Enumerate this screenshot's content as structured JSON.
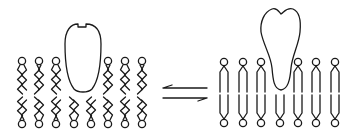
{
  "diagram": {
    "colors": {
      "stroke": "#1a1a1a",
      "background": "#ffffff"
    },
    "left_panel": {
      "state": "disordered-bilayer",
      "protein": {
        "shape": "rounded-capsule-with-notch",
        "x": 64,
        "y": 22,
        "width": 38,
        "height": 70
      },
      "top_leaflet_heads_x": [
        22,
        39,
        56,
        108,
        125,
        142
      ],
      "top_leaflet_y": 61,
      "bottom_leaflet_heads_x": [
        22,
        39,
        56,
        74,
        91,
        108,
        125,
        142
      ],
      "bottom_leaflet_y": 124,
      "tail_style": "wavy"
    },
    "equilibrium_arrows": {
      "top": {
        "direction": "left",
        "y": 88,
        "x1": 163,
        "x2": 207
      },
      "bottom": {
        "direction": "right",
        "y": 98,
        "x1": 163,
        "x2": 207
      }
    },
    "right_panel": {
      "state": "ordered-bilayer",
      "protein": {
        "shape": "bilobed-top-tapered-bottom",
        "x": 259,
        "y": 7,
        "width": 43,
        "height": 83
      },
      "top_leaflet_heads_x": [
        224,
        243,
        261,
        298,
        316,
        335
      ],
      "top_leaflet_y": 62,
      "bottom_leaflet_heads_x": [
        224,
        243,
        261,
        280,
        298,
        316,
        335
      ],
      "bottom_leaflet_y": 123,
      "tail_style": "straight"
    }
  }
}
